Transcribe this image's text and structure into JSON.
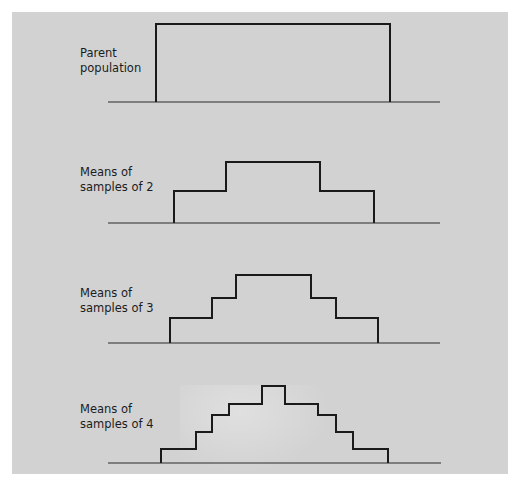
{
  "colors": {
    "background": "#ffffff",
    "panel": "#d2d2d2",
    "line": "#1a1a1a",
    "baseline": "#2a2a2a",
    "text": "#1c1c1c"
  },
  "panels": [
    {
      "id": "parent",
      "label_lines": [
        "Parent",
        "population"
      ],
      "label_pos": {
        "x": 80,
        "y": 46
      },
      "baseline": {
        "x1": 108,
        "x2": 440,
        "y": 102
      },
      "outline": [
        [
          156,
          102
        ],
        [
          156,
          24
        ],
        [
          390,
          24
        ],
        [
          390,
          102
        ]
      ]
    },
    {
      "id": "samples-2",
      "label_lines": [
        "Means of",
        "samples of 2"
      ],
      "label_pos": {
        "x": 80,
        "y": 165
      },
      "baseline": {
        "x1": 108,
        "x2": 440,
        "y": 223
      },
      "outline": [
        [
          174,
          223
        ],
        [
          174,
          191
        ],
        [
          226,
          191
        ],
        [
          226,
          162
        ],
        [
          320,
          162
        ],
        [
          320,
          191
        ],
        [
          374,
          191
        ],
        [
          374,
          223
        ]
      ]
    },
    {
      "id": "samples-3",
      "label_lines": [
        "Means of",
        "samples of 3"
      ],
      "label_pos": {
        "x": 80,
        "y": 286
      },
      "baseline": {
        "x1": 108,
        "x2": 440,
        "y": 343
      },
      "outline": [
        [
          170,
          343
        ],
        [
          170,
          318
        ],
        [
          212,
          318
        ],
        [
          212,
          298
        ],
        [
          236,
          298
        ],
        [
          236,
          275
        ],
        [
          311,
          275
        ],
        [
          311,
          298
        ],
        [
          336,
          298
        ],
        [
          336,
          318
        ],
        [
          378,
          318
        ],
        [
          378,
          343
        ]
      ]
    },
    {
      "id": "samples-4",
      "label_lines": [
        "Means of",
        "samples of 4"
      ],
      "label_pos": {
        "x": 80,
        "y": 402
      },
      "baseline": {
        "x1": 108,
        "x2": 441,
        "y": 463
      },
      "outline": [
        [
          161,
          463
        ],
        [
          161,
          449
        ],
        [
          196,
          449
        ],
        [
          196,
          432
        ],
        [
          212,
          432
        ],
        [
          212,
          415
        ],
        [
          229,
          415
        ],
        [
          229,
          404
        ],
        [
          262,
          404
        ],
        [
          262,
          386
        ],
        [
          285,
          386
        ],
        [
          285,
          404
        ],
        [
          318,
          404
        ],
        [
          318,
          415
        ],
        [
          336,
          415
        ],
        [
          336,
          432
        ],
        [
          353,
          432
        ],
        [
          353,
          449
        ],
        [
          388,
          449
        ],
        [
          388,
          463
        ]
      ]
    }
  ]
}
